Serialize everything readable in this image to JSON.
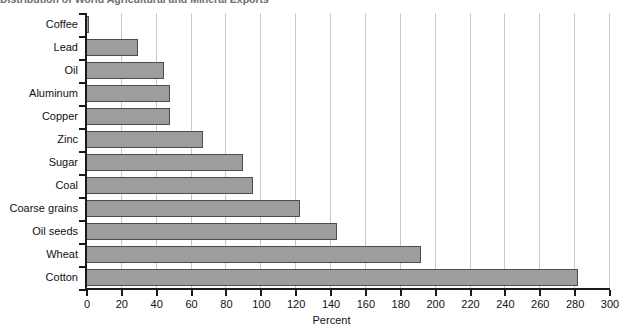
{
  "figure": {
    "cutoff_title": "Distribution of World Agricultural and Mineral Exports",
    "xaxis_title": "Percent"
  },
  "chart_data": {
    "type": "bar",
    "orientation": "horizontal",
    "title": "",
    "xlabel": "Percent",
    "ylabel": "",
    "xlim": [
      0,
      300
    ],
    "xticks": [
      0,
      20,
      40,
      60,
      80,
      100,
      120,
      140,
      160,
      180,
      200,
      220,
      240,
      260,
      280,
      300
    ],
    "grid": "vertical",
    "legend": "none",
    "bar_color": "#9d9d9d",
    "bar_edge_color": "#4c4c4c",
    "categories": [
      "Coffee",
      "Lead",
      "Oil",
      "Aluminum",
      "Copper",
      "Zinc",
      "Sugar",
      "Coal",
      "Coarse grains",
      "Oil seeds",
      "Wheat",
      "Cotton"
    ],
    "values": [
      2,
      30,
      45,
      48,
      48,
      67,
      90,
      96,
      123,
      144,
      192,
      282
    ]
  }
}
